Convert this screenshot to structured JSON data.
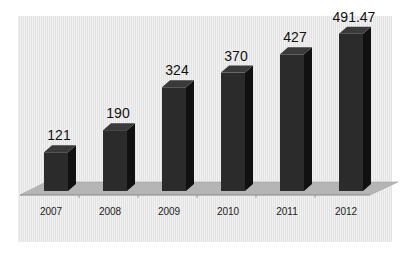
{
  "chart_data": {
    "type": "bar",
    "style": "3d-column",
    "title": "",
    "xlabel": "",
    "ylabel": "",
    "categories": [
      "2007",
      "2008",
      "2009",
      "2010",
      "2011",
      "2012"
    ],
    "values": [
      121,
      190,
      324,
      370,
      427,
      491.47
    ],
    "data_labels": [
      "121",
      "190",
      "324",
      "370",
      "427",
      "491.47"
    ],
    "ylim": [
      0,
      500
    ],
    "grid": false,
    "legend": null,
    "colors": {
      "bar_front": "#2b2b2b",
      "bar_side": "#111111",
      "bar_top": "#3a3a3a",
      "floor": "#b5b5b5",
      "background": "#ececec"
    }
  }
}
